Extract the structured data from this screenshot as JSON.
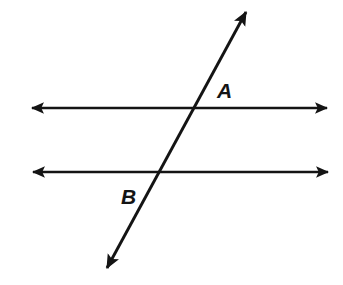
{
  "figure": {
    "background_color": "#ffffff",
    "stroke_color": "#141414",
    "width": 343,
    "height": 285
  },
  "labels": {
    "upper_intersection": "A",
    "lower_intersection": "B"
  },
  "chart_data": {
    "type": "diagram",
    "subtype": "geometry-parallel-lines-transversal",
    "xlabel": "",
    "ylabel": "",
    "grid": false,
    "legend": false,
    "xlim": [
      0,
      343
    ],
    "ylim": [
      0,
      285
    ],
    "stroke_color": "#141414",
    "stroke_width": 2.6,
    "lines": [
      {
        "name": "upper-parallel-line",
        "kind": "double-headed-ray",
        "x1": 32,
        "y1": 108,
        "x2": 327,
        "y2": 108,
        "arrow_start": true,
        "arrow_end": true,
        "orientation": "horizontal"
      },
      {
        "name": "lower-parallel-line",
        "kind": "double-headed-ray",
        "x1": 33,
        "y1": 172,
        "x2": 328,
        "y2": 172,
        "arrow_start": true,
        "arrow_end": true,
        "orientation": "horizontal"
      },
      {
        "name": "transversal-line",
        "kind": "double-headed-ray",
        "x1": 107,
        "y1": 268,
        "x2": 246,
        "y2": 12,
        "arrow_start": true,
        "arrow_end": true,
        "orientation": "oblique"
      }
    ],
    "points": [
      {
        "name": "A",
        "label": "A",
        "x": 194,
        "y": 108,
        "label_x": 217,
        "label_y": 90
      },
      {
        "name": "B",
        "label": "B",
        "x": 156,
        "y": 172,
        "label_x": 121,
        "label_y": 196
      }
    ],
    "arrowhead": {
      "length": 13,
      "width": 10,
      "filled": true
    }
  }
}
